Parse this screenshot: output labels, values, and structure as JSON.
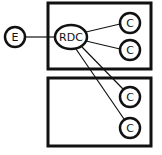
{
  "diagram": {
    "external_node": {
      "label": "E"
    },
    "hub_node": {
      "label": "RDC"
    },
    "top_group": {
      "children": [
        {
          "label": "C"
        },
        {
          "label": "C"
        }
      ]
    },
    "bottom_group": {
      "children": [
        {
          "label": "C"
        },
        {
          "label": "C"
        }
      ]
    },
    "colors": {
      "stroke": "#111111",
      "background": "#ffffff"
    }
  }
}
